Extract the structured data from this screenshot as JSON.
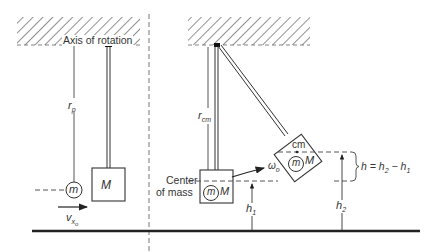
{
  "figure": {
    "left_panel": {
      "axis_label": "Axis of rotation",
      "radius_label": "r",
      "radius_sub": "p",
      "bullet_mass_label": "m",
      "block_mass_label": "M",
      "velocity_label": "v",
      "velocity_sub": "x",
      "velocity_sub2": "o"
    },
    "right_panel": {
      "radius_label": "r",
      "radius_sub": "cm",
      "center_of_mass_label_line1": "Center",
      "center_of_mass_label_line2": "of mass",
      "bullet_mass_label": "m",
      "block_mass_label": "M",
      "omega_label": "ω",
      "omega_sub": "o",
      "cm_label": "cm",
      "height1_label": "h",
      "height1_sub": "1",
      "height2_label": "h",
      "height2_sub": "2",
      "height_diff_label": "h = h",
      "height_diff_sub1": "2",
      "height_diff_minus": " − h",
      "height_diff_sub2": "1"
    },
    "colors": {
      "ink": "#333333",
      "line": "#444444",
      "floor": "#222222"
    }
  }
}
